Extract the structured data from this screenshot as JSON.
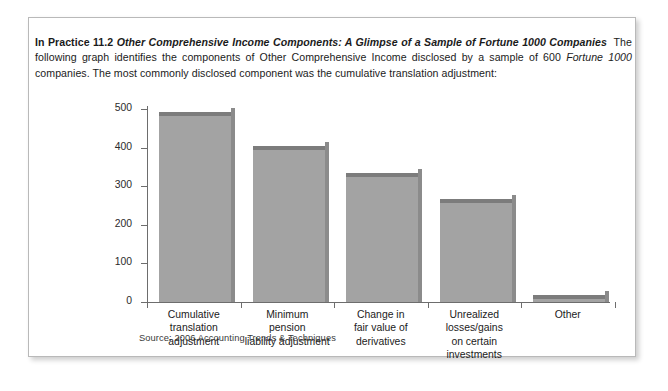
{
  "panel": {
    "intro": {
      "lead_prefix": "In Practice 11.2",
      "lead_title": "Other Comprehensive Income Components: A Glimpse of a Sample of Fortune 1000 Companies",
      "body_1": "The following graph identifies the components of Other Comprehensive Income disclosed by a sample of 600 ",
      "body_italic": "Fortune 1000",
      "body_2": " companies. The most commonly disclosed component was the cumulative translation adjustment:"
    },
    "source_note": "Source: 2006 Accounting Trends & Techniques"
  },
  "chart_data": {
    "type": "bar",
    "title": "",
    "subtitle": "",
    "xlabel": "",
    "ylabel": "",
    "ylim": [
      0,
      500
    ],
    "yticks": [
      0,
      100,
      200,
      300,
      400,
      500
    ],
    "ytick_labels": [
      "0",
      "100",
      "200",
      "300",
      "400",
      "500"
    ],
    "grid": false,
    "legend": false,
    "bar_color": "#a3a3a3",
    "bar_top_color": "#7c7c7c",
    "bar_side_color": "#8b8b8b",
    "axis_color": "#6d6d6d",
    "categories": [
      "Cumulative\ntranslation adjustment",
      "Minimum\npension\nliability adjustment",
      "Change in\nfair value of\nderivatives",
      "Unrealized\nlosses/gains\non certain investments",
      "Other"
    ],
    "values": [
      492,
      405,
      333,
      266,
      18
    ]
  }
}
